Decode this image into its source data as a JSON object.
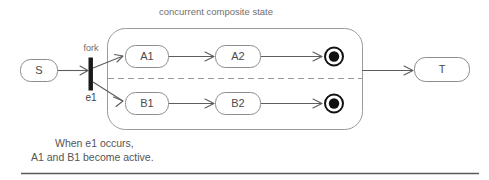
{
  "diagram": {
    "title": "concurrent composite state",
    "caption_line_1": "When e1 occurs,",
    "caption_line_2": "A1 and B1 become active.",
    "colors": {
      "node_stroke": "#8d8d8d",
      "edge": "#5d5d5d",
      "composite_stroke": "#9a9a9a",
      "final_state": "#111111",
      "text": "#4a4a4a",
      "background": "#ffffff"
    },
    "states": {
      "source": "S",
      "target": "T",
      "region_a": [
        "A1",
        "A2"
      ],
      "region_b": [
        "B1",
        "B2"
      ]
    },
    "labels": {
      "fork": "fork",
      "event": "e1"
    },
    "icons": {
      "fork_bar": "fork-bar-icon",
      "final_state_a": "final-state-icon",
      "final_state_b": "final-state-icon"
    }
  }
}
